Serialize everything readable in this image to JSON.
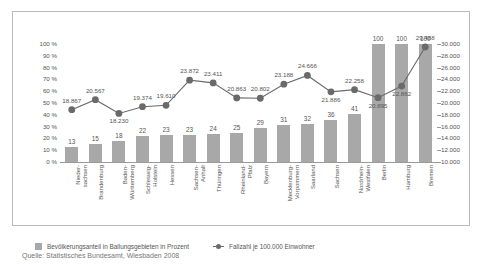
{
  "chart_data": {
    "type": "bar",
    "title": "",
    "xlabel": "",
    "ylabel": "",
    "grid": false,
    "legend_position": "bottom-left",
    "categories": [
      "Nieder-\nsachsen",
      "Brandenburg",
      "Baden-\nWürttemberg",
      "Schleswig-\nHolstein",
      "Hessen",
      "Sachsen-\nAnhalt",
      "Thüringen",
      "Rheinland-\nPfalz",
      "Bayern",
      "Mecklenburg-\nVorpommern",
      "Saarland",
      "Sachsen",
      "Nordrhein-\nWestfalen",
      "Berlin",
      "Hamburg",
      "Bremen"
    ],
    "series": [
      {
        "name": "Bevölkerungsanteil in Ballungsgebieten in Prozent",
        "type": "bar",
        "axis": "left",
        "color": "#a8a8a8",
        "values": [
          13,
          15,
          18,
          22,
          23,
          23,
          24,
          25,
          29,
          31,
          32,
          36,
          41,
          100,
          100,
          100
        ],
        "labels": [
          "13",
          "15",
          "18",
          "22",
          "23",
          "23",
          "24",
          "25",
          "29",
          "31",
          "32",
          "36",
          "41",
          "100",
          "100",
          "100"
        ]
      },
      {
        "name": "Fallzahl je 100.000 Einwohner",
        "type": "line",
        "axis": "right",
        "color": "#6a6a6a",
        "values": [
          18867,
          20567,
          18230,
          19374,
          19610,
          23872,
          23411,
          20863,
          20802,
          23188,
          24666,
          21886,
          22258,
          20895,
          22862,
          29488
        ],
        "labels": [
          "18.867",
          "20.567",
          "18.230",
          "19.374",
          "19.610",
          "23.872",
          "23.411",
          "20.863",
          "20.802",
          "23.188",
          "24.666",
          "21.886",
          "22.258",
          "20.895",
          "22.862",
          "29.488"
        ]
      }
    ],
    "y_left": {
      "ylim": [
        0,
        100
      ],
      "ticks": [
        0,
        10,
        20,
        30,
        40,
        50,
        60,
        70,
        80,
        90,
        100
      ],
      "tick_labels": [
        "0 %",
        "10 %",
        "20 %",
        "30 %",
        "40 %",
        "50 %",
        "60 %",
        "70 %",
        "80 %",
        "90 %",
        "100 %"
      ]
    },
    "y_right": {
      "ylim": [
        10000,
        30000
      ],
      "ticks": [
        10000,
        12000,
        14000,
        16000,
        18000,
        20000,
        22000,
        24000,
        26000,
        28000,
        30000
      ],
      "tick_labels": [
        "10.000",
        "12.000",
        "14.000",
        "16.000",
        "18.000",
        "20.000",
        "22.000",
        "24.000",
        "26.000",
        "28.000",
        "30.000"
      ]
    }
  },
  "legend": {
    "bar_label": "Bevölkerungsanteil in Ballungsgebieten in Prozent",
    "line_label": "Fallzahl je 100.000 Einwohner"
  },
  "source": {
    "text": "Quelle: Statistisches Bundesamt, Wiesbaden 2008"
  },
  "colors": {
    "bar": "#a8a8a8",
    "line": "#6a6a6a",
    "frame": "#b9b9b9",
    "text": "#555555"
  }
}
